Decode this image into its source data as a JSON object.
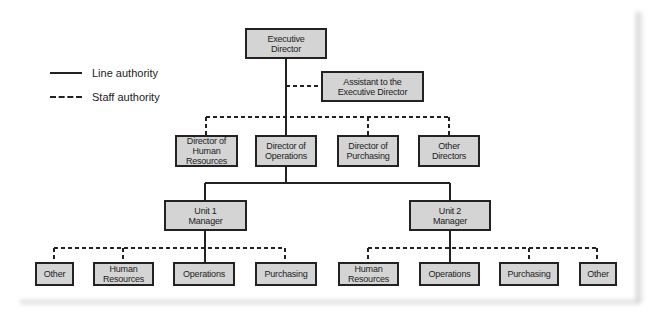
{
  "legend": {
    "line_authority": "Line authority",
    "staff_authority": "Staff authority"
  },
  "nodes": {
    "executive_director": "Executive Director",
    "assistant": "Assistant to the Executive Director",
    "directors": [
      {
        "label": "Director of Human Resources"
      },
      {
        "label": "Director of Operations"
      },
      {
        "label": "Director of Purchasing"
      },
      {
        "label": "Other Directors"
      }
    ],
    "unit1_manager": "Unit 1 Manager",
    "unit2_manager": "Unit 2 Manager",
    "unit1_staff": [
      {
        "label": "Other"
      },
      {
        "label": "Human Resources"
      },
      {
        "label": "Operations"
      },
      {
        "label": "Purchasing"
      }
    ],
    "unit2_staff": [
      {
        "label": "Human Resources"
      },
      {
        "label": "Operations"
      },
      {
        "label": "Purchasing"
      },
      {
        "label": "Other"
      }
    ]
  },
  "colors": {
    "box_fill": "#d4d4d4",
    "line": "#222222"
  }
}
